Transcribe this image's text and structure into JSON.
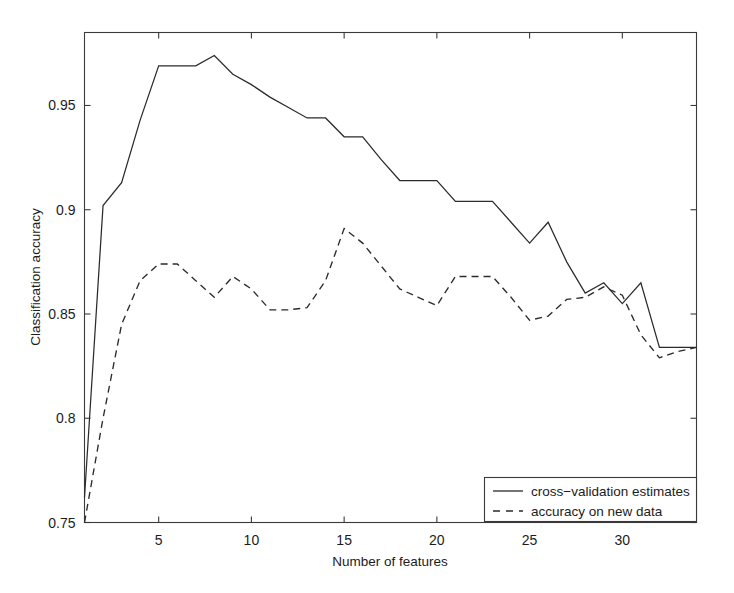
{
  "chart_data": {
    "type": "line",
    "title": "",
    "xlabel": "Number of features",
    "ylabel": "Classification accuracy",
    "xlim": [
      1,
      34
    ],
    "ylim": [
      0.75,
      0.985
    ],
    "grid": false,
    "legend_position": "bottom-right",
    "xticks": [
      5,
      10,
      15,
      20,
      25,
      30
    ],
    "xtick_labels": [
      "5",
      "10",
      "15",
      "20",
      "25",
      "30"
    ],
    "yticks": [
      0.75,
      0.8,
      0.85,
      0.9,
      0.95
    ],
    "ytick_labels": [
      "0.75",
      "0.8",
      "0.85",
      "0.9",
      "0.95"
    ],
    "x": [
      1,
      2,
      3,
      4,
      5,
      6,
      7,
      8,
      9,
      10,
      11,
      12,
      13,
      14,
      15,
      16,
      17,
      18,
      19,
      20,
      21,
      22,
      23,
      24,
      25,
      26,
      27,
      28,
      29,
      30,
      31,
      32,
      33,
      34
    ],
    "series": [
      {
        "name": "cross-validation estimates",
        "style": "solid",
        "values": [
          0.762,
          0.902,
          0.913,
          0.943,
          0.969,
          0.969,
          0.969,
          0.974,
          0.965,
          0.96,
          0.954,
          0.949,
          0.944,
          0.944,
          0.935,
          0.935,
          0.924,
          0.914,
          0.914,
          0.914,
          0.904,
          0.904,
          0.904,
          0.894,
          0.884,
          0.894,
          0.875,
          0.86,
          0.865,
          0.855,
          0.865,
          0.834,
          0.834,
          0.834
        ]
      },
      {
        "name": "accuracy on new data",
        "style": "dashed",
        "values": [
          0.75,
          0.8,
          0.845,
          0.866,
          0.874,
          0.874,
          0.866,
          0.858,
          0.868,
          0.862,
          0.852,
          0.852,
          0.853,
          0.866,
          0.891,
          0.884,
          0.873,
          0.862,
          0.858,
          0.854,
          0.868,
          0.868,
          0.868,
          0.858,
          0.847,
          0.849,
          0.857,
          0.858,
          0.863,
          0.859,
          0.84,
          0.829,
          0.832,
          0.834
        ]
      }
    ]
  },
  "legend": {
    "entries": [
      {
        "label": "cross−validation estimates",
        "style": "solid"
      },
      {
        "label": "accuracy on new data",
        "style": "dashed"
      }
    ]
  },
  "colors": {
    "line": "#2b2b2b",
    "axis": "#3a3a3a",
    "background": "#ffffff"
  }
}
